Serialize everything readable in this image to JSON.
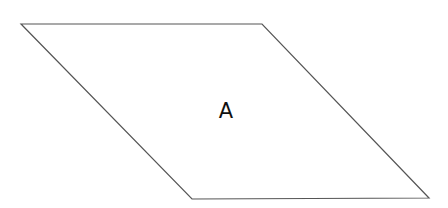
{
  "diagram": {
    "shape": {
      "type": "parallelogram",
      "points": [
        [
          21,
          24
        ],
        [
          262,
          24
        ],
        [
          429,
          198
        ],
        [
          192,
          199
        ]
      ],
      "stroke": "#555555",
      "fill": "#ffffff"
    },
    "label": {
      "text": "A",
      "x": 226,
      "y": 118
    }
  }
}
